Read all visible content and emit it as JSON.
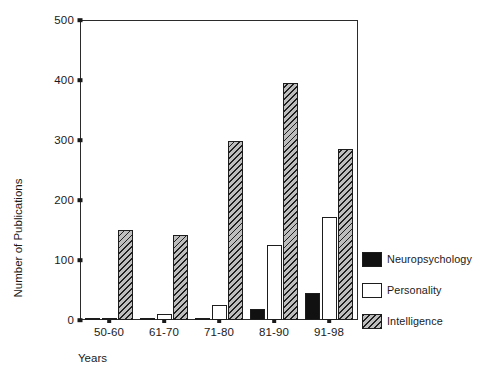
{
  "chart_data": {
    "type": "bar",
    "title": "",
    "xlabel": "Years",
    "ylabel": "Number of Publications",
    "categories": [
      "50-60",
      "61-70",
      "71-80",
      "81-90",
      "91-98"
    ],
    "series": [
      {
        "name": "Neuropsychology",
        "values": [
          2,
          1,
          3,
          18,
          45
        ],
        "color": "#111111",
        "fill": "solid-black"
      },
      {
        "name": "Personality",
        "values": [
          2,
          10,
          25,
          125,
          172
        ],
        "color": "#ffffff",
        "fill": "white-outline"
      },
      {
        "name": "Intelligence",
        "values": [
          150,
          142,
          298,
          395,
          285
        ],
        "color": "#bdbdbd",
        "fill": "diagonal-hatch"
      }
    ],
    "ylim": [
      0,
      500
    ],
    "yticks": [
      0,
      100,
      200,
      300,
      400,
      500
    ],
    "ytick_labels": [
      "0",
      "100",
      "200",
      "300",
      "400",
      "500"
    ],
    "grid": false,
    "legend_position": "right"
  },
  "legend": {
    "items": [
      {
        "label": "Neuropsychology"
      },
      {
        "label": "Personality"
      },
      {
        "label": "Intelligence"
      }
    ]
  }
}
